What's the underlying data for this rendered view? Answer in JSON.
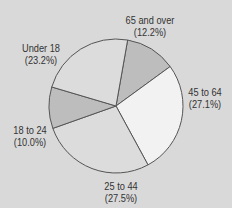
{
  "chart_data": {
    "type": "pie",
    "title": "",
    "slices": [
      {
        "label": "65 and over",
        "pct_text": "(12.2%)",
        "value": 12.2,
        "color": "#bdbdbd"
      },
      {
        "label": "45 to 64",
        "pct_text": "(27.1%)",
        "value": 27.1,
        "color": "#f2f2f2"
      },
      {
        "label": "25 to 44",
        "pct_text": "(27.5%)",
        "value": 27.5,
        "color": "#dcdcdc"
      },
      {
        "label": "18 to 24",
        "pct_text": "(10.0%)",
        "value": 10.0,
        "color": "#bdbdbd"
      },
      {
        "label": "Under 18",
        "pct_text": "(23.2%)",
        "value": 23.2,
        "color": "#dcdcdc"
      }
    ],
    "legend": "none (direct labels)"
  },
  "colors": {
    "background": "#d9d9d9",
    "outline": "#555555"
  }
}
